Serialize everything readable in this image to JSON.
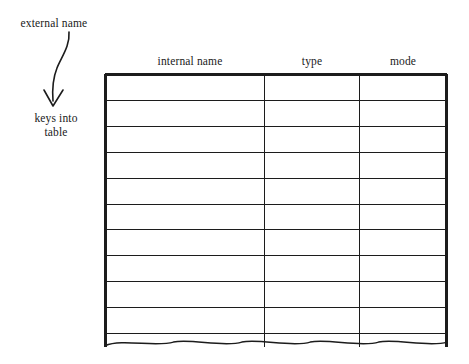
{
  "figure": {
    "kind": "symbol-table-diagram",
    "background_color": "#ffffff",
    "ink_color": "#1c1c1c"
  },
  "annotations": {
    "external_name": "external name",
    "keys_into_table": "keys into\ntable",
    "keys_into_table_line1": "keys into",
    "keys_into_table_line2": "table",
    "arrow": {
      "icon": "curved-down-arrow-icon",
      "from_label": "external name",
      "to_label": "keys into table"
    }
  },
  "table": {
    "columns": [
      {
        "id": "internal-name",
        "label": "internal name"
      },
      {
        "id": "type",
        "label": "type"
      },
      {
        "id": "mode",
        "label": "mode"
      }
    ],
    "row_count": 11,
    "rows_are_empty": true,
    "bottom_edge": "torn-wavy",
    "geometry": {
      "left": 105,
      "right": 447,
      "top": 74,
      "last_rule": 333,
      "divider_1": 264,
      "divider_2": 359
    }
  }
}
